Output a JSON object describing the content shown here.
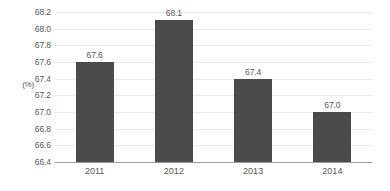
{
  "chart_data": {
    "type": "bar",
    "title": "",
    "subtitle": "",
    "xlabel": "",
    "ylabel": "(%)",
    "categories": [
      "2011",
      "2012",
      "2013",
      "2014"
    ],
    "values": [
      67.6,
      68.1,
      67.4,
      67.0
    ],
    "value_labels": [
      "67.6",
      "68.1",
      "67.4",
      "67.0"
    ],
    "ylim": [
      66.4,
      68.2
    ],
    "ytick_step": 0.2,
    "ytick_labels": [
      "68.2",
      "68.0",
      "67.8",
      "67.6",
      "67.4",
      "67.2",
      "67.0",
      "66.8",
      "66.6",
      "66.4"
    ],
    "ytick_values": [
      68.2,
      68.0,
      67.8,
      67.6,
      67.4,
      67.2,
      67.0,
      66.8,
      66.6,
      66.4
    ],
    "grid": true,
    "legend": false,
    "legend_position": "none",
    "series": [
      {
        "name": "",
        "values": [
          67.6,
          68.1,
          67.4,
          67.0
        ]
      }
    ],
    "colors": {
      "bar": "#4b4b4d",
      "grid": "#e9e9ea",
      "baseline": "#9b9b9d",
      "text": "#58585a",
      "background": "#ffffff"
    }
  }
}
